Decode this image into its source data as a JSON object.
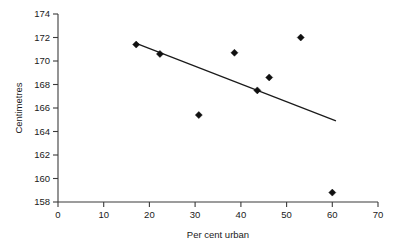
{
  "chart_data": {
    "type": "scatter",
    "title": "",
    "xlabel": "Per cent urban",
    "ylabel": "Centimetres",
    "xlim": [
      0,
      70
    ],
    "ylim": [
      158,
      174
    ],
    "xticks": [
      0,
      10,
      20,
      30,
      40,
      50,
      60,
      70
    ],
    "yticks": [
      158,
      160,
      162,
      164,
      166,
      168,
      170,
      172,
      174
    ],
    "xtick_labels": [
      "0",
      "10",
      "20",
      "30",
      "40",
      "50",
      "60",
      "70"
    ],
    "ytick_labels": [
      "158",
      "160",
      "162",
      "164",
      "166",
      "168",
      "170",
      "172",
      "174"
    ],
    "grid": false,
    "legend": null,
    "marker": "diamond",
    "point_color": "#101010",
    "line_color": "#1a1a1a",
    "axis_color": "#3b3b3b",
    "points": [
      {
        "x": 17.1,
        "y": 171.4
      },
      {
        "x": 22.3,
        "y": 170.6
      },
      {
        "x": 30.8,
        "y": 165.4
      },
      {
        "x": 38.6,
        "y": 170.7
      },
      {
        "x": 43.6,
        "y": 167.5
      },
      {
        "x": 46.2,
        "y": 168.6
      },
      {
        "x": 53.1,
        "y": 172.0
      },
      {
        "x": 60.0,
        "y": 158.8
      }
    ],
    "series": [
      {
        "name": "observations",
        "x": [
          17.1,
          22.3,
          30.8,
          38.6,
          43.6,
          46.2,
          53.1,
          60.0
        ],
        "values": [
          171.4,
          170.6,
          165.4,
          170.7,
          167.5,
          168.6,
          172.0,
          158.8
        ]
      }
    ],
    "trendline": {
      "type": "linear-fit",
      "x_start": 17.1,
      "y_start": 171.5,
      "x_end": 60.8,
      "y_end": 164.9
    }
  }
}
